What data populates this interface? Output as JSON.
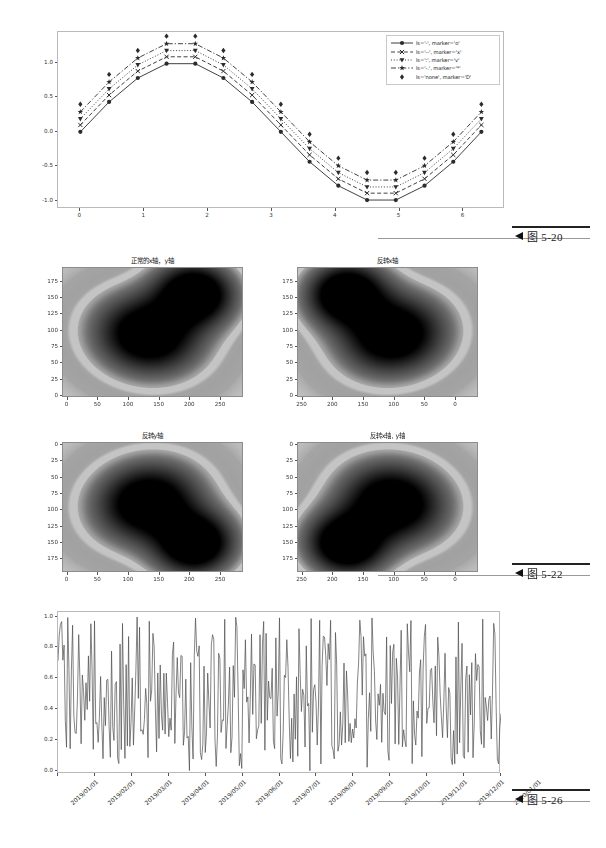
{
  "page": {
    "background": "#ffffff",
    "captions": [
      {
        "name": "fig-5-20",
        "marker": "◀",
        "text": "图 5-20"
      },
      {
        "name": "fig-5-22",
        "marker": "◀",
        "text": "图 5-22"
      },
      {
        "name": "fig-5-26",
        "marker": "◀",
        "text": "图 5-26"
      }
    ]
  },
  "chart_data": [
    {
      "id": "linestyle-marker-demo",
      "type": "line",
      "title": "",
      "xlabel": "",
      "ylabel": "",
      "xlim": [
        -0.35,
        6.65
      ],
      "ylim": [
        -1.12,
        1.45
      ],
      "xticks": [
        "0",
        "1",
        "2",
        "3",
        "4",
        "5",
        "6"
      ],
      "xtick_values": [
        0,
        1,
        2,
        3,
        4,
        5,
        6
      ],
      "yticks": [
        "-1.0",
        "-0.5",
        "0.0",
        "0.5",
        "1.0"
      ],
      "ytick_values": [
        -1.0,
        -0.5,
        0.0,
        0.5,
        1.0
      ],
      "grid": false,
      "legend_position": "upper right",
      "x": [
        0.0,
        0.45,
        0.9,
        1.35,
        1.8,
        2.24,
        2.69,
        3.14,
        3.59,
        4.04,
        4.49,
        4.94,
        5.39,
        5.84,
        6.28
      ],
      "series": [
        {
          "name": "ls='-', marker='o'",
          "linestyle": "solid",
          "marker": "o",
          "offset": 0.0,
          "values": [
            0.0,
            0.434,
            0.782,
            0.99,
            0.99,
            0.782,
            0.434,
            0.0,
            -0.434,
            -0.782,
            -0.99,
            -0.99,
            -0.782,
            -0.434,
            0.0
          ]
        },
        {
          "name": "ls='--', marker='x'",
          "linestyle": "dashed",
          "marker": "x",
          "offset": 0.1,
          "values": [
            0.1,
            0.534,
            0.882,
            1.09,
            1.09,
            0.882,
            0.534,
            0.1,
            -0.334,
            -0.682,
            -0.89,
            -0.89,
            -0.682,
            -0.334,
            0.1
          ]
        },
        {
          "name": "ls=':', marker='v'",
          "linestyle": "dotted",
          "marker": "v",
          "offset": 0.19,
          "values": [
            0.19,
            0.624,
            0.972,
            1.18,
            1.18,
            0.972,
            0.624,
            0.19,
            -0.244,
            -0.592,
            -0.8,
            -0.8,
            -0.592,
            -0.244,
            0.19
          ]
        },
        {
          "name": "ls='-.', marker='*'",
          "linestyle": "dashdot",
          "marker": "*",
          "offset": 0.29,
          "values": [
            0.29,
            0.724,
            1.072,
            1.28,
            1.28,
            1.072,
            0.724,
            0.29,
            -0.144,
            -0.492,
            -0.7,
            -0.7,
            -0.492,
            -0.144,
            0.29
          ]
        },
        {
          "name": "ls='none', marker='D'",
          "linestyle": "none",
          "marker": "D",
          "offset": 0.4,
          "values": [
            0.4,
            0.834,
            1.182,
            1.39,
            1.39,
            1.182,
            0.834,
            0.4,
            -0.034,
            -0.382,
            -0.59,
            -0.59,
            -0.382,
            -0.034,
            0.4
          ]
        }
      ]
    },
    {
      "id": "heatmap-normal",
      "type": "heatmap",
      "title": "正常的x轴，y轴",
      "xticks": [
        "0",
        "50",
        "100",
        "150",
        "200",
        "250"
      ],
      "yticks": [
        "0",
        "25",
        "50",
        "75",
        "100",
        "125",
        "150",
        "175"
      ],
      "x_reversed": false,
      "y_reversed": false,
      "colormap": "gray_r",
      "blobs": [
        {
          "cx": 0.47,
          "cy": 0.52,
          "rx": 0.2,
          "ry": 0.22,
          "rot": -28
        },
        {
          "cx": 0.74,
          "cy": 0.19,
          "rx": 0.15,
          "ry": 0.17,
          "rot": -20
        }
      ]
    },
    {
      "id": "heatmap-flip-x",
      "type": "heatmap",
      "title": "反转x轴",
      "xticks": [
        "250",
        "200",
        "150",
        "100",
        "50",
        "0"
      ],
      "yticks": [
        "0",
        "25",
        "50",
        "75",
        "100",
        "125",
        "150",
        "175"
      ],
      "x_reversed": true,
      "y_reversed": false,
      "colormap": "gray_r",
      "blobs": [
        {
          "cx": 0.53,
          "cy": 0.52,
          "rx": 0.2,
          "ry": 0.22,
          "rot": 28
        },
        {
          "cx": 0.26,
          "cy": 0.19,
          "rx": 0.15,
          "ry": 0.17,
          "rot": 20
        }
      ]
    },
    {
      "id": "heatmap-flip-y",
      "type": "heatmap",
      "title": "反转y轴",
      "xticks": [
        "0",
        "50",
        "100",
        "150",
        "200",
        "250"
      ],
      "yticks": [
        "0",
        "25",
        "50",
        "75",
        "100",
        "125",
        "150",
        "175"
      ],
      "x_reversed": false,
      "y_reversed": true,
      "colormap": "gray_r",
      "blobs": [
        {
          "cx": 0.47,
          "cy": 0.46,
          "rx": 0.2,
          "ry": 0.22,
          "rot": 28
        },
        {
          "cx": 0.74,
          "cy": 0.79,
          "rx": 0.15,
          "ry": 0.17,
          "rot": 20
        }
      ]
    },
    {
      "id": "heatmap-flip-xy",
      "type": "heatmap",
      "title": "反转x轴, y轴",
      "xticks": [
        "250",
        "200",
        "150",
        "100",
        "50",
        "0"
      ],
      "yticks": [
        "0",
        "25",
        "50",
        "75",
        "100",
        "125",
        "150",
        "175"
      ],
      "x_reversed": true,
      "y_reversed": true,
      "colormap": "gray_r",
      "blobs": [
        {
          "cx": 0.53,
          "cy": 0.46,
          "rx": 0.2,
          "ry": 0.22,
          "rot": -28
        },
        {
          "cx": 0.26,
          "cy": 0.79,
          "rx": 0.15,
          "ry": 0.17,
          "rot": -20
        }
      ]
    },
    {
      "id": "date-axis-random-series",
      "type": "line",
      "title": "",
      "xlabel": "",
      "ylabel": "",
      "ylim": [
        -0.02,
        1.03
      ],
      "yticks": [
        "0.0",
        "0.2",
        "0.4",
        "0.6",
        "0.8",
        "1.0"
      ],
      "ytick_values": [
        0.0,
        0.2,
        0.4,
        0.6,
        0.8,
        1.0
      ],
      "xticks": [
        "2019/01/01",
        "2019/02/01",
        "2019/03/01",
        "2019/04/01",
        "2019/05/01",
        "2019/06/01",
        "2019/07/01",
        "2019/08/01",
        "2019/09/01",
        "2019/10/01",
        "2019/11/01",
        "2019/12/01",
        "2020/01/01"
      ],
      "grid": false,
      "line_color": "#4d4d4d",
      "n_points": 365,
      "description": "uniform random noise between 0 and 1, one point per day"
    }
  ]
}
